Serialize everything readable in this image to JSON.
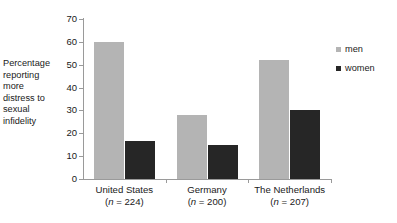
{
  "chart_data": {
    "type": "bar",
    "title": "",
    "xlabel": "",
    "ylabel": "Percentage reporting more distress to sexual infidelity",
    "ylim": [
      0,
      70
    ],
    "yticks": [
      0,
      10,
      20,
      30,
      40,
      50,
      60,
      70
    ],
    "grid": false,
    "legend_position": "right",
    "categories": [
      "United States",
      "Germany",
      "The Netherlands"
    ],
    "category_sublabels": [
      "(n = 224)",
      "(n = 200)",
      "(n = 207)"
    ],
    "category_n": [
      224,
      200,
      207
    ],
    "series": [
      {
        "name": "men",
        "color": "#b4b4b4",
        "values": [
          60,
          28,
          52
        ]
      },
      {
        "name": "women",
        "color": "#262626",
        "values": [
          16.5,
          15,
          30
        ]
      }
    ]
  },
  "y_axis_title_lines": [
    "Percentage",
    "reporting",
    "more",
    "distress to",
    "sexual",
    "infidelity"
  ],
  "y_tick_labels": [
    "70",
    "60",
    "50",
    "40",
    "30",
    "20",
    "10",
    "0"
  ],
  "legend": {
    "items": [
      {
        "label": "men",
        "color": "#b4b4b4"
      },
      {
        "label": "women",
        "color": "#262626"
      }
    ]
  },
  "categories": [
    {
      "name": "United States",
      "n_prefix": "(",
      "n_var": "n",
      "n_rest": " = 224)"
    },
    {
      "name": "Germany",
      "n_prefix": "(",
      "n_var": "n",
      "n_rest": " = 200)"
    },
    {
      "name": "The Netherlands",
      "n_prefix": "(",
      "n_var": "n",
      "n_rest": " = 207)"
    }
  ],
  "colors": {
    "men": "#b4b4b4",
    "women": "#262626",
    "axis": "#9a9a9a",
    "text": "#1a1a1a",
    "background": "#ffffff"
  }
}
